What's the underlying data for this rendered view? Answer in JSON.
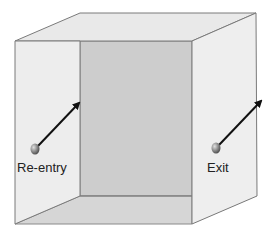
{
  "diagram": {
    "type": "3d-box-room",
    "colors": {
      "top_face": "#e9e9e9",
      "back_wall": "#cdcdcd",
      "left_wall": "#ededed",
      "right_wall": "#eeeeee",
      "floor": "#d6d6d6",
      "edge": "#7a7a7a",
      "arrow": "#111111",
      "ball": "#8a8a8a"
    },
    "markers": [
      {
        "id": "re-entry",
        "label": "Re-entry"
      },
      {
        "id": "exit",
        "label": "Exit"
      }
    ]
  }
}
